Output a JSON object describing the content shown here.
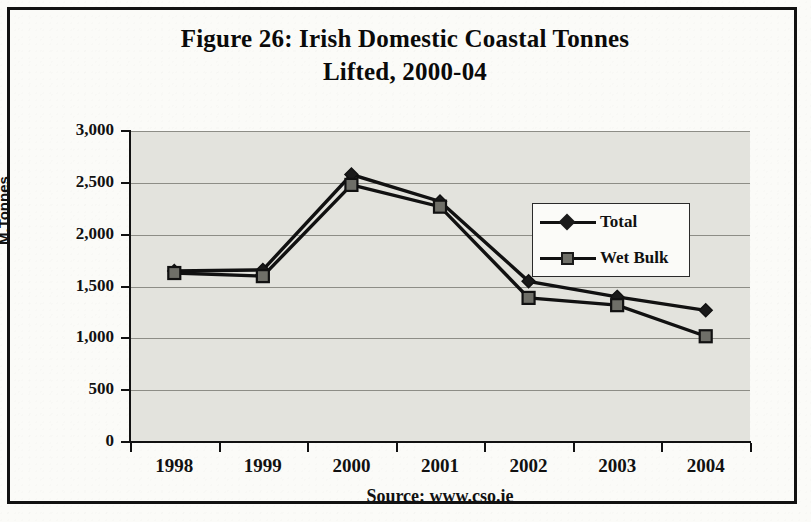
{
  "figure": {
    "title_line1": "Figure 26: Irish Domestic Coastal Tonnes",
    "title_line2": "Lifted, 2000-04",
    "source": "Source: www.cso.ie"
  },
  "chart_data": {
    "type": "line",
    "title": "Figure 26: Irish Domestic Coastal Tonnes Lifted, 2000-04",
    "xlabel": "",
    "ylabel": "M.Tonnes",
    "categories": [
      "1998",
      "1999",
      "2000",
      "2001",
      "2002",
      "2003",
      "2004"
    ],
    "series": [
      {
        "name": "Total",
        "marker": "diamond",
        "values": [
          1650,
          1660,
          2580,
          2320,
          1550,
          1400,
          1270
        ]
      },
      {
        "name": "Wet Bulk",
        "marker": "square",
        "values": [
          1630,
          1600,
          2480,
          2270,
          1390,
          1320,
          1020
        ]
      }
    ],
    "ylim": [
      0,
      3000
    ],
    "ytick_labels": [
      "3,000",
      "2,500",
      "2,000",
      "1,500",
      "1,000",
      "500",
      "0"
    ],
    "ytick_values": [
      3000,
      2500,
      2000,
      1500,
      1000,
      500,
      0
    ],
    "grid": true,
    "legend_position": "center-right",
    "annotations": [
      "Source: www.cso.ie"
    ],
    "colors": {
      "plot_background": "#e3e3dd",
      "line": "#111111",
      "gridline": "#8d8d86",
      "marker_total_fill": "#1a1a1a",
      "marker_wetbulk_fill": "#6f6f68"
    }
  }
}
